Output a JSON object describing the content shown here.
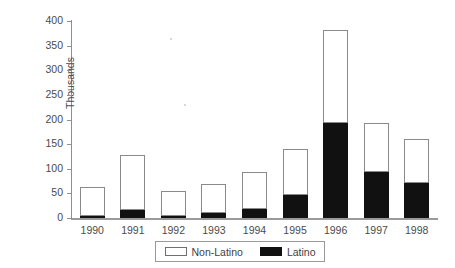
{
  "chart_data": {
    "type": "bar",
    "stacked": true,
    "title": "",
    "xlabel": "",
    "ylabel": "Thousands",
    "categories": [
      "1990",
      "1991",
      "1992",
      "1993",
      "1994",
      "1995",
      "1996",
      "1997",
      "1998"
    ],
    "series": [
      {
        "name": "Latino",
        "color": "#111111",
        "values": [
          5,
          16,
          5,
          10,
          18,
          47,
          193,
          94,
          71
        ]
      },
      {
        "name": "Non-Latino",
        "color": "#ffffff",
        "values": [
          57,
          111,
          50,
          59,
          75,
          93,
          188,
          99,
          89
        ]
      }
    ],
    "totals": [
      62,
      127,
      55,
      69,
      93,
      140,
      381,
      193,
      160
    ],
    "ylim": [
      0,
      400
    ],
    "yticks": [
      0,
      50,
      100,
      150,
      200,
      250,
      300,
      350,
      400
    ],
    "ytick_labels": [
      "0",
      "50",
      "100",
      "150",
      "200",
      "250",
      "300",
      "350",
      "400"
    ],
    "grid": false,
    "legend_position": "bottom",
    "legend_entries": [
      {
        "label": "Non-Latino",
        "swatch": "white"
      },
      {
        "label": "Latino",
        "swatch": "black"
      }
    ]
  }
}
